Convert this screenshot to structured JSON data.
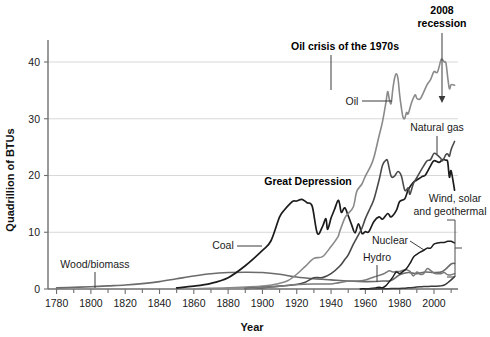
{
  "chart_data": {
    "type": "line",
    "title": "",
    "xlabel": "Year",
    "ylabel": "Quadrillion of BTUs",
    "xlim": [
      1775,
      2014
    ],
    "ylim": [
      0,
      44
    ],
    "xticks": [
      1780,
      1800,
      1820,
      1840,
      1860,
      1880,
      1900,
      1920,
      1940,
      1960,
      1980,
      2000
    ],
    "xtick_labels": [
      "1780",
      "1800",
      "1820",
      "1840",
      "1860",
      "1880",
      "1900",
      "1920",
      "1940",
      "1960",
      "1980",
      "2000"
    ],
    "xminor_step": 10,
    "yticks": [
      0,
      10,
      20,
      30,
      40
    ],
    "ytick_labels": [
      "0",
      "10",
      "20",
      "30",
      "40"
    ],
    "grid": "horizontal",
    "legend": "inline-labels",
    "series": [
      {
        "name": "Wood/biomass",
        "color": "#6b6b6b",
        "width": 1.6,
        "points": [
          [
            1780,
            0.2
          ],
          [
            1790,
            0.3
          ],
          [
            1800,
            0.4
          ],
          [
            1810,
            0.55
          ],
          [
            1820,
            0.7
          ],
          [
            1830,
            0.95
          ],
          [
            1840,
            1.3
          ],
          [
            1850,
            1.8
          ],
          [
            1860,
            2.3
          ],
          [
            1870,
            2.7
          ],
          [
            1880,
            2.9
          ],
          [
            1890,
            2.95
          ],
          [
            1900,
            2.9
          ],
          [
            1910,
            2.6
          ],
          [
            1920,
            2.1
          ],
          [
            1930,
            1.8
          ],
          [
            1940,
            1.6
          ],
          [
            1950,
            1.4
          ],
          [
            1960,
            1.3
          ],
          [
            1970,
            1.4
          ],
          [
            1975,
            1.5
          ],
          [
            1980,
            2.5
          ],
          [
            1985,
            2.9
          ],
          [
            1990,
            2.7
          ],
          [
            1995,
            3.0
          ],
          [
            2000,
            2.9
          ],
          [
            2005,
            3.1
          ],
          [
            2010,
            4.4
          ],
          [
            2012,
            4.5
          ]
        ]
      },
      {
        "name": "Coal",
        "color": "#1c1c1c",
        "width": 1.7,
        "points": [
          [
            1850,
            0.2
          ],
          [
            1860,
            0.5
          ],
          [
            1870,
            1.0
          ],
          [
            1880,
            2.0
          ],
          [
            1890,
            4.1
          ],
          [
            1900,
            6.8
          ],
          [
            1905,
            8.5
          ],
          [
            1910,
            12.7
          ],
          [
            1913,
            14.0
          ],
          [
            1916,
            15.0
          ],
          [
            1918,
            15.5
          ],
          [
            1920,
            15.5
          ],
          [
            1923,
            15.8
          ],
          [
            1926,
            15.2
          ],
          [
            1929,
            14.6
          ],
          [
            1932,
            9.8
          ],
          [
            1935,
            11.0
          ],
          [
            1937,
            12.4
          ],
          [
            1938,
            10.5
          ],
          [
            1940,
            12.5
          ],
          [
            1942,
            14.0
          ],
          [
            1944,
            15.6
          ],
          [
            1945,
            15.0
          ],
          [
            1946,
            13.5
          ],
          [
            1948,
            14.3
          ],
          [
            1950,
            12.9
          ],
          [
            1952,
            11.3
          ],
          [
            1954,
            9.9
          ],
          [
            1956,
            11.5
          ],
          [
            1958,
            9.8
          ],
          [
            1960,
            10.1
          ],
          [
            1962,
            10.1
          ],
          [
            1965,
            11.9
          ],
          [
            1968,
            12.7
          ],
          [
            1970,
            12.3
          ],
          [
            1973,
            13.3
          ],
          [
            1975,
            12.7
          ],
          [
            1978,
            13.8
          ],
          [
            1980,
            15.4
          ],
          [
            1983,
            15.9
          ],
          [
            1985,
            17.5
          ],
          [
            1988,
            18.8
          ],
          [
            1990,
            19.2
          ],
          [
            1993,
            19.8
          ],
          [
            1995,
            20.1
          ],
          [
            1998,
            21.7
          ],
          [
            2000,
            22.6
          ],
          [
            2003,
            22.3
          ],
          [
            2005,
            22.8
          ],
          [
            2007,
            22.7
          ],
          [
            2008,
            22.4
          ],
          [
            2009,
            19.7
          ],
          [
            2010,
            20.8
          ],
          [
            2012,
            17.4
          ]
        ]
      },
      {
        "name": "Oil",
        "color": "#8a8a8a",
        "width": 1.6,
        "points": [
          [
            1860,
            0.05
          ],
          [
            1880,
            0.2
          ],
          [
            1900,
            0.5
          ],
          [
            1910,
            1.0
          ],
          [
            1915,
            1.5
          ],
          [
            1920,
            2.6
          ],
          [
            1925,
            4.0
          ],
          [
            1930,
            5.4
          ],
          [
            1935,
            5.7
          ],
          [
            1940,
            7.5
          ],
          [
            1944,
            9.2
          ],
          [
            1945,
            10.1
          ],
          [
            1948,
            12.5
          ],
          [
            1950,
            13.3
          ],
          [
            1953,
            14.5
          ],
          [
            1955,
            17.2
          ],
          [
            1958,
            18.5
          ],
          [
            1960,
            19.9
          ],
          [
            1963,
            21.6
          ],
          [
            1965,
            23.2
          ],
          [
            1968,
            27.0
          ],
          [
            1970,
            29.5
          ],
          [
            1972,
            32.9
          ],
          [
            1973,
            34.8
          ],
          [
            1974,
            33.4
          ],
          [
            1975,
            32.7
          ],
          [
            1976,
            35.2
          ],
          [
            1977,
            37.1
          ],
          [
            1978,
            37.9
          ],
          [
            1979,
            37.1
          ],
          [
            1980,
            34.2
          ],
          [
            1981,
            31.9
          ],
          [
            1982,
            30.2
          ],
          [
            1983,
            30.1
          ],
          [
            1984,
            31.1
          ],
          [
            1985,
            30.9
          ],
          [
            1987,
            32.9
          ],
          [
            1989,
            34.2
          ],
          [
            1990,
            33.6
          ],
          [
            1992,
            33.5
          ],
          [
            1994,
            34.7
          ],
          [
            1996,
            36.0
          ],
          [
            1998,
            36.9
          ],
          [
            2000,
            38.3
          ],
          [
            2002,
            38.2
          ],
          [
            2004,
            40.3
          ],
          [
            2005,
            40.4
          ],
          [
            2006,
            40.0
          ],
          [
            2007,
            39.8
          ],
          [
            2008,
            37.3
          ],
          [
            2009,
            35.3
          ],
          [
            2010,
            36.0
          ],
          [
            2012,
            35.9
          ]
        ]
      },
      {
        "name": "Natural gas",
        "color": "#4a4a4a",
        "width": 1.6,
        "points": [
          [
            1890,
            0.1
          ],
          [
            1900,
            0.25
          ],
          [
            1910,
            0.5
          ],
          [
            1920,
            0.8
          ],
          [
            1925,
            1.2
          ],
          [
            1930,
            2.0
          ],
          [
            1935,
            2.0
          ],
          [
            1940,
            2.7
          ],
          [
            1945,
            4.0
          ],
          [
            1948,
            5.2
          ],
          [
            1950,
            6.0
          ],
          [
            1953,
            7.9
          ],
          [
            1955,
            9.0
          ],
          [
            1958,
            10.7
          ],
          [
            1960,
            12.4
          ],
          [
            1963,
            14.4
          ],
          [
            1965,
            15.8
          ],
          [
            1968,
            19.2
          ],
          [
            1970,
            21.8
          ],
          [
            1972,
            22.7
          ],
          [
            1973,
            22.5
          ],
          [
            1975,
            19.9
          ],
          [
            1977,
            19.9
          ],
          [
            1979,
            20.7
          ],
          [
            1981,
            19.9
          ],
          [
            1983,
            17.4
          ],
          [
            1985,
            17.8
          ],
          [
            1986,
            16.7
          ],
          [
            1988,
            18.6
          ],
          [
            1990,
            19.6
          ],
          [
            1992,
            20.7
          ],
          [
            1994,
            21.7
          ],
          [
            1996,
            22.6
          ],
          [
            1998,
            22.8
          ],
          [
            2000,
            23.9
          ],
          [
            2002,
            23.6
          ],
          [
            2004,
            23.0
          ],
          [
            2005,
            22.6
          ],
          [
            2007,
            23.7
          ],
          [
            2008,
            23.8
          ],
          [
            2009,
            23.4
          ],
          [
            2010,
            24.6
          ],
          [
            2012,
            26.0
          ]
        ]
      },
      {
        "name": "Hydro",
        "color": "#7a7a7a",
        "width": 1.5,
        "points": [
          [
            1890,
            0.02
          ],
          [
            1900,
            0.25
          ],
          [
            1910,
            0.5
          ],
          [
            1920,
            0.8
          ],
          [
            1930,
            0.9
          ],
          [
            1940,
            0.9
          ],
          [
            1950,
            1.4
          ],
          [
            1955,
            1.4
          ],
          [
            1960,
            1.6
          ],
          [
            1965,
            2.1
          ],
          [
            1970,
            2.6
          ],
          [
            1972,
            2.9
          ],
          [
            1974,
            3.2
          ],
          [
            1976,
            3.0
          ],
          [
            1978,
            3.1
          ],
          [
            1980,
            3.1
          ],
          [
            1982,
            3.3
          ],
          [
            1984,
            3.4
          ],
          [
            1986,
            3.1
          ],
          [
            1988,
            2.3
          ],
          [
            1990,
            3.0
          ],
          [
            1992,
            2.6
          ],
          [
            1994,
            2.7
          ],
          [
            1996,
            3.6
          ],
          [
            1998,
            3.3
          ],
          [
            2000,
            2.8
          ],
          [
            2002,
            2.7
          ],
          [
            2004,
            2.7
          ],
          [
            2006,
            2.9
          ],
          [
            2008,
            2.5
          ],
          [
            2010,
            2.5
          ],
          [
            2012,
            2.7
          ]
        ]
      },
      {
        "name": "Nuclear",
        "color": "#1c1c1c",
        "width": 1.5,
        "points": [
          [
            1957,
            0.02
          ],
          [
            1960,
            0.05
          ],
          [
            1963,
            0.1
          ],
          [
            1966,
            0.2
          ],
          [
            1968,
            0.3
          ],
          [
            1970,
            0.24
          ],
          [
            1972,
            0.6
          ],
          [
            1974,
            1.3
          ],
          [
            1976,
            2.1
          ],
          [
            1978,
            3.0
          ],
          [
            1980,
            2.7
          ],
          [
            1982,
            3.1
          ],
          [
            1984,
            3.6
          ],
          [
            1986,
            4.5
          ],
          [
            1988,
            5.6
          ],
          [
            1990,
            6.1
          ],
          [
            1992,
            6.5
          ],
          [
            1994,
            6.8
          ],
          [
            1996,
            7.2
          ],
          [
            1998,
            7.2
          ],
          [
            2000,
            7.9
          ],
          [
            2002,
            8.1
          ],
          [
            2004,
            8.2
          ],
          [
            2006,
            8.2
          ],
          [
            2008,
            8.4
          ],
          [
            2010,
            8.4
          ],
          [
            2012,
            8.1
          ]
        ]
      },
      {
        "name": "Wind, solar and geothermal",
        "color": "#3a3a3a",
        "width": 1.5,
        "points": [
          [
            1960,
            0.01
          ],
          [
            1970,
            0.03
          ],
          [
            1975,
            0.07
          ],
          [
            1980,
            0.11
          ],
          [
            1983,
            0.13
          ],
          [
            1985,
            0.2
          ],
          [
            1988,
            0.25
          ],
          [
            1990,
            0.35
          ],
          [
            1993,
            0.4
          ],
          [
            1995,
            0.45
          ],
          [
            1997,
            0.46
          ],
          [
            2000,
            0.47
          ],
          [
            2002,
            0.5
          ],
          [
            2004,
            0.55
          ],
          [
            2006,
            0.7
          ],
          [
            2008,
            1.1
          ],
          [
            2010,
            1.6
          ],
          [
            2012,
            2.2
          ]
        ]
      }
    ],
    "series_labels": [
      {
        "name": "Wood/biomass",
        "text": "Wood/biomass",
        "x": 95,
        "y": 268,
        "anchor": "middle",
        "bold": false
      },
      {
        "name": "Coal",
        "text": "Coal",
        "x": 223,
        "y": 249,
        "anchor": "middle",
        "bold": false
      },
      {
        "name": "Oil",
        "text": "Oil",
        "x": 352,
        "y": 105,
        "anchor": "middle",
        "bold": false
      },
      {
        "name": "Natural gas",
        "text": "Natural gas",
        "x": 437,
        "y": 131,
        "anchor": "middle",
        "bold": false
      },
      {
        "name": "Hydro",
        "text": "Hydro",
        "x": 377,
        "y": 261,
        "anchor": "middle",
        "bold": false
      },
      {
        "name": "Nuclear",
        "text": "Nuclear",
        "x": 390,
        "y": 244,
        "anchor": "middle",
        "bold": false
      },
      {
        "name": "Wind, solar and geothermal",
        "text": "Wind, solar",
        "x": 455,
        "y": 202,
        "anchor": "middle",
        "bold": false
      },
      {
        "name": "Wind, solar and geothermal 2",
        "text": "and geothermal",
        "x": 450,
        "y": 215,
        "anchor": "middle",
        "bold": false
      }
    ],
    "annotations": [
      {
        "name": "great-depression",
        "text": "Great Depression",
        "x": 308,
        "y": 185,
        "anchor": "middle",
        "bold": true
      },
      {
        "name": "oil-crisis-1970s",
        "text": "Oil crisis of the 1970s",
        "x": 345,
        "y": 50,
        "anchor": "middle",
        "bold": true
      },
      {
        "name": "recession-2008-line1",
        "text": "2008",
        "x": 442,
        "y": 14,
        "anchor": "middle",
        "bold": true
      },
      {
        "name": "recession-2008-line2",
        "text": "recession",
        "x": 442,
        "y": 27,
        "anchor": "middle",
        "bold": true
      }
    ]
  }
}
